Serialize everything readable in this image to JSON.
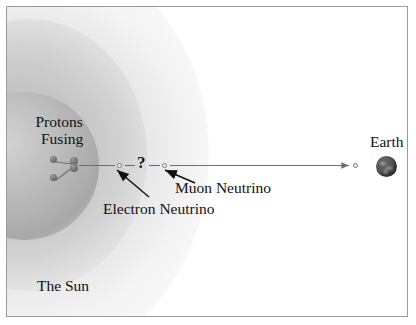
{
  "diagram": {
    "type": "physics-illustration",
    "labels": {
      "protons_fusing_line1": "Protons",
      "protons_fusing_line2": "Fusing",
      "the_sun": "The Sun",
      "earth": "Earth",
      "electron_neutrino": "Electron Neutrino",
      "muon_neutrino": "Muon Neutrino",
      "question_mark": "?"
    },
    "nodes": [
      {
        "name": "proton-a",
        "kind": "proton",
        "x": 46,
        "y": 152
      },
      {
        "name": "proton-b",
        "kind": "proton",
        "x": 46,
        "y": 170
      },
      {
        "name": "deuteron-top",
        "kind": "proton",
        "x": 67,
        "y": 154
      },
      {
        "name": "deuteron-bottom",
        "kind": "proton",
        "x": 67,
        "y": 161
      },
      {
        "name": "electron-neutrino-node",
        "kind": "neutrino",
        "x": 112,
        "y": 158
      },
      {
        "name": "muon-neutrino-node",
        "kind": "neutrino",
        "x": 157,
        "y": 158
      },
      {
        "name": "earth-arrival-node",
        "kind": "neutrino",
        "x": 348,
        "y": 158
      }
    ],
    "colors": {
      "background": "#ffffff",
      "frame_border": "#9a9a9a",
      "sun_core": "#b4b4b4",
      "sun_halo": "#d8d8d8",
      "particle": "#6f6f6f",
      "trajectory_line": "#6e6e6e",
      "text": "#111111",
      "earth": "#4e4e4e"
    },
    "annotations": {
      "electron_neutrino_arrow": "points up-right from label to electron neutrino node",
      "muon_neutrino_arrow": "points up-left from label to muon neutrino node"
    }
  }
}
